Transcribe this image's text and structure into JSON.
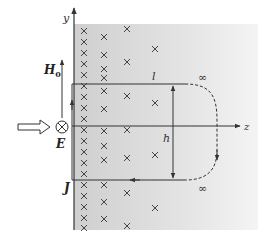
{
  "labels": {
    "y_axis": "y",
    "z_axis": "z",
    "H0": "H",
    "H0_sub": "0",
    "E": "E",
    "J": "J",
    "l": "l",
    "h": "h",
    "inf_top": "∞",
    "inf_bottom": "∞"
  },
  "colors": {
    "conductor_fill": "#d9d9d9",
    "line": "#333333",
    "background": "#ffffff"
  },
  "crosses": [
    [
      84,
      31
    ],
    [
      104,
      37
    ],
    [
      127,
      29
    ],
    [
      84,
      42
    ],
    [
      84,
      53
    ],
    [
      104,
      55
    ],
    [
      155,
      49
    ],
    [
      84,
      64
    ],
    [
      104,
      69
    ],
    [
      127,
      62
    ],
    [
      84,
      75
    ],
    [
      104,
      78
    ],
    [
      84,
      86
    ],
    [
      104,
      91
    ],
    [
      127,
      96
    ],
    [
      84,
      97
    ],
    [
      104,
      109
    ],
    [
      155,
      103
    ],
    [
      84,
      108
    ],
    [
      84,
      119
    ],
    [
      84,
      130
    ],
    [
      104,
      131
    ],
    [
      127,
      130
    ],
    [
      84,
      141
    ],
    [
      104,
      146
    ],
    [
      84,
      152
    ],
    [
      104,
      160
    ],
    [
      127,
      158
    ],
    [
      155,
      155
    ],
    [
      84,
      163
    ],
    [
      84,
      174
    ],
    [
      84,
      185
    ],
    [
      104,
      185
    ],
    [
      84,
      196
    ],
    [
      104,
      202
    ],
    [
      127,
      193
    ],
    [
      84,
      207
    ],
    [
      155,
      208
    ],
    [
      84,
      218
    ],
    [
      104,
      219
    ],
    [
      127,
      226
    ],
    [
      84,
      228
    ]
  ]
}
